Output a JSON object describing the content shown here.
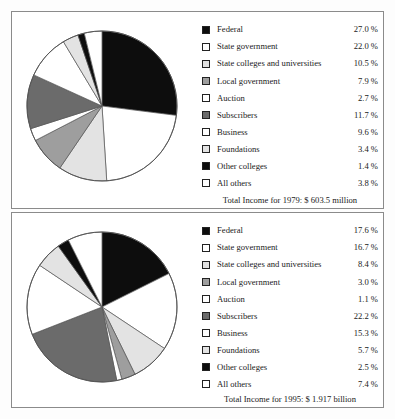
{
  "chart_data": [
    {
      "type": "pie",
      "title": "Total Income for 1979: $ 603.5 million",
      "year": "1979",
      "legend_position": "right",
      "categories": [
        "Federal",
        "State government",
        "State colleges and universities",
        "Local government",
        "Auction",
        "Subscribers",
        "Business",
        "Foundations",
        "Other colleges",
        "All others"
      ],
      "values": [
        27.0,
        22.0,
        10.5,
        7.9,
        2.7,
        11.7,
        9.6,
        3.4,
        1.4,
        3.8
      ],
      "value_labels": [
        "27.0 %",
        "22.0 %",
        "10.5 %",
        "7.9 %",
        "2.7 %",
        "11.7 %",
        "9.6 %",
        "3.4 %",
        "1.4 %",
        "3.8 %"
      ],
      "swatch_fills": [
        "black",
        "white",
        "light",
        "mid",
        "white",
        "dark",
        "white",
        "light",
        "black",
        "white"
      ],
      "xlabel": "",
      "ylabel": ""
    },
    {
      "type": "pie",
      "title": "Total Income for 1995: $ 1.917 billion",
      "year": "1995",
      "legend_position": "right",
      "categories": [
        "Federal",
        "State government",
        "State colleges and universities",
        "Local government",
        "Auction",
        "Subscribers",
        "Business",
        "Foundations",
        "Other colleges",
        "All others"
      ],
      "values": [
        17.6,
        16.7,
        8.4,
        3.0,
        1.1,
        22.2,
        15.3,
        5.7,
        2.5,
        7.4
      ],
      "value_labels": [
        "17.6 %",
        "16.7 %",
        "8.4 %",
        "3.0 %",
        "1.1 %",
        "22.2 %",
        "15.3 %",
        "5.7 %",
        "2.5 %",
        "7.4 %"
      ],
      "swatch_fills": [
        "black",
        "white",
        "light",
        "mid",
        "white",
        "dark",
        "white",
        "light",
        "black",
        "white"
      ],
      "xlabel": "",
      "ylabel": ""
    }
  ],
  "panels": [
    {
      "id": "1979",
      "legend": [
        {
          "label": "Federal",
          "value": "27.0 %",
          "fill": "black"
        },
        {
          "label": "State government",
          "value": "22.0 %",
          "fill": "white"
        },
        {
          "label": "State colleges and universities",
          "value": "10.5 %",
          "fill": "light"
        },
        {
          "label": "Local government",
          "value": "7.9 %",
          "fill": "mid"
        },
        {
          "label": "Auction",
          "value": "2.7 %",
          "fill": "white"
        },
        {
          "label": "Subscribers",
          "value": "11.7 %",
          "fill": "dark"
        },
        {
          "label": "Business",
          "value": "9.6 %",
          "fill": "white"
        },
        {
          "label": "Foundations",
          "value": "3.4 %",
          "fill": "light"
        },
        {
          "label": "Other colleges",
          "value": "1.4 %",
          "fill": "black"
        },
        {
          "label": "All others",
          "value": "3.8 %",
          "fill": "white"
        }
      ],
      "footer": "Total Income for 1979: $ 603.5 million"
    },
    {
      "id": "1995",
      "legend": [
        {
          "label": "Federal",
          "value": "17.6 %",
          "fill": "black"
        },
        {
          "label": "State government",
          "value": "16.7 %",
          "fill": "white"
        },
        {
          "label": "State colleges and universities",
          "value": "8.4 %",
          "fill": "light"
        },
        {
          "label": "Local government",
          "value": "3.0 %",
          "fill": "mid"
        },
        {
          "label": "Auction",
          "value": "1.1 %",
          "fill": "white"
        },
        {
          "label": "Subscribers",
          "value": "22.2 %",
          "fill": "dark"
        },
        {
          "label": "Business",
          "value": "15.3 %",
          "fill": "white"
        },
        {
          "label": "Foundations",
          "value": "5.7 %",
          "fill": "light"
        },
        {
          "label": "Other colleges",
          "value": "2.5 %",
          "fill": "black"
        },
        {
          "label": "All others",
          "value": "7.4 %",
          "fill": "white"
        }
      ],
      "footer": "Total Income for 1995: $ 1.917 billion"
    }
  ],
  "colors": {
    "black": "#0d0d0d",
    "white": "#ffffff",
    "light": "#e3e3e3",
    "mid": "#9e9e9e",
    "dark": "#6b6b6b",
    "vlight": "#f1f1f1",
    "outline": "#555555",
    "panel_border": "#8b8b8b"
  }
}
